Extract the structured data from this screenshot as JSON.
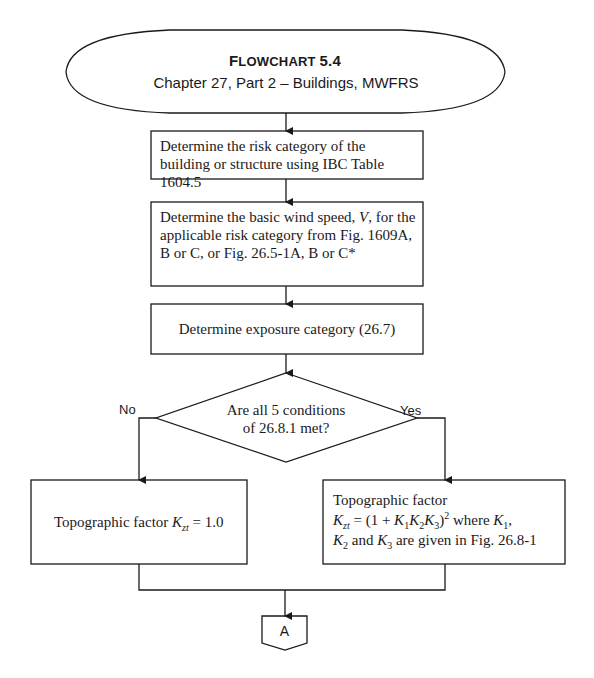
{
  "terminal": {
    "title_first": "F",
    "title_rest": "LOWCHART",
    "title_number": "5.4",
    "subtitle": "Chapter 27, Part 2 – Buildings, MWFRS"
  },
  "steps": [
    {
      "text": "Determine the risk category of the building or structure using IBC Table 1604.5"
    },
    {
      "text_before_var": "Determine the basic wind speed, ",
      "var": "V",
      "text_after_var": ", for the applicable risk category from Fig. 1609A, B or C, or Fig. 26.5-1A, B or C*"
    },
    {
      "text": "Determine exposure category (26.7)"
    }
  ],
  "decision": {
    "line1": "Are all 5 conditions",
    "line2": "of 26.8.1 met?",
    "no_label": "No",
    "yes_label": "Yes"
  },
  "no_branch": {
    "label": "Topographic factor",
    "var": "K",
    "sub": "zt",
    "eq": "= 1.0"
  },
  "yes_branch": {
    "label": "Topographic factor",
    "formula_var": "K",
    "formula_sub": "zt",
    "formula_eq": " = (1 + ",
    "k1": "K",
    "k1_sub": "1",
    "k2": "K",
    "k2_sub": "2",
    "k3": "K",
    "k3_sub": "3",
    "formula_close": ")",
    "formula_pow": "2",
    "where": " where ",
    "w_k": "K",
    "w_k_sub": "1",
    "comma": ",",
    "l2_k2": "K",
    "l2_k2_sub": "2",
    "l2_and": " and ",
    "l2_k3": "K",
    "l2_k3_sub": "3",
    "l2_rest": " are given in Fig. 26.8-1"
  },
  "connector": {
    "label": "A"
  },
  "colors": {
    "line": "#1a1a1a",
    "background": "#ffffff"
  }
}
